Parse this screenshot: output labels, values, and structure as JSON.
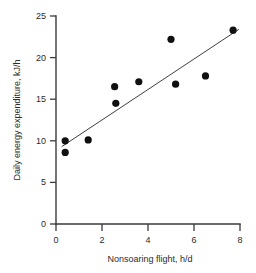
{
  "chart_data": {
    "type": "scatter",
    "title": "",
    "xlabel": "Nonsoaring flight, h/d",
    "ylabel": "Daily energy expenditure, kJ/h",
    "xlim": [
      0,
      8
    ],
    "ylim": [
      0,
      25
    ],
    "xticks": [
      0,
      2,
      4,
      6,
      8
    ],
    "yticks": [
      0,
      5,
      10,
      15,
      20,
      25
    ],
    "xtick_labels": [
      "0",
      "2",
      "4",
      "6",
      "8"
    ],
    "ytick_labels": [
      "0",
      "5",
      "10",
      "15",
      "20",
      "25"
    ],
    "grid": false,
    "legend": null,
    "marker": "filled-circle",
    "marker_color": "#101010",
    "line_color": "#3f3f3f",
    "axis_color": "#3a3a3a",
    "background": "#ffffff",
    "points": [
      {
        "x": 0.4,
        "y": 10.0
      },
      {
        "x": 0.4,
        "y": 8.6
      },
      {
        "x": 1.4,
        "y": 10.1
      },
      {
        "x": 2.55,
        "y": 16.5
      },
      {
        "x": 2.6,
        "y": 14.5
      },
      {
        "x": 3.6,
        "y": 17.1
      },
      {
        "x": 5.0,
        "y": 22.2
      },
      {
        "x": 5.2,
        "y": 16.8
      },
      {
        "x": 6.5,
        "y": 17.8
      },
      {
        "x": 7.7,
        "y": 23.3
      }
    ],
    "series": [
      {
        "name": "Observations",
        "x": [
          0.4,
          0.4,
          1.4,
          2.55,
          2.6,
          3.6,
          5.0,
          5.2,
          6.5,
          7.7
        ],
        "values": [
          10.0,
          8.6,
          10.1,
          16.5,
          14.5,
          17.1,
          22.2,
          16.8,
          17.8,
          23.3
        ]
      }
    ],
    "fit_line": {
      "type": "linear-regression",
      "x_start": 0.25,
      "y_start": 9.3,
      "x_end": 7.95,
      "y_end": 23.4
    }
  }
}
